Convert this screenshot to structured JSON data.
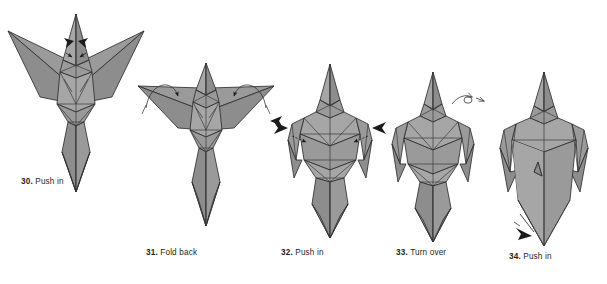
{
  "document": {
    "title": "Origami folding instructions — steps 30 to 34",
    "background_color": "#ffffff"
  },
  "style": {
    "paper_fill_light": "#a6a6a6",
    "paper_fill_mid": "#9a9a9a",
    "paper_fill_dark": "#8d8d8d",
    "paper_fill_darkest": "#818181",
    "crease_line_color": "#3a3a3a",
    "outline_color": "#2f2f2f",
    "arrow_fill": "#1a1a1a",
    "caption_color": "#231f20"
  },
  "steps": [
    {
      "id": "step-30",
      "number": "30.",
      "instruction": "Push in",
      "caption": "30. Push in",
      "arrows": [
        {
          "name": "push-in-arrow-left",
          "type": "solid-triangle",
          "direction": "right"
        },
        {
          "name": "push-in-arrow-right",
          "type": "solid-triangle",
          "direction": "left"
        }
      ]
    },
    {
      "id": "step-31",
      "number": "31.",
      "instruction": "Fold back",
      "caption": "31. Fold back",
      "arrows": [
        {
          "name": "fold-back-arrow-left",
          "type": "curved-loop",
          "direction": "down-left"
        },
        {
          "name": "fold-back-arrow-right",
          "type": "curved-loop",
          "direction": "down-right"
        },
        {
          "name": "push-in-arrow-right-edge",
          "type": "solid-triangle",
          "direction": "left"
        }
      ]
    },
    {
      "id": "step-32",
      "number": "32.",
      "instruction": "Push in",
      "caption": "32. Push in",
      "arrows": [
        {
          "name": "push-in-arrow-left",
          "type": "solid-triangle",
          "direction": "right"
        },
        {
          "name": "push-in-arrow-right",
          "type": "solid-triangle",
          "direction": "left"
        }
      ]
    },
    {
      "id": "step-33",
      "number": "33.",
      "instruction": "Turn over",
      "caption": "33. Turn over",
      "arrows": [
        {
          "name": "turn-over-arrow",
          "type": "loop-outline",
          "direction": "right"
        }
      ]
    },
    {
      "id": "step-34",
      "number": "34.",
      "instruction": "Push in",
      "caption": "34. Push in",
      "arrows": [
        {
          "name": "push-in-arrow-tail",
          "type": "solid-triangle",
          "direction": "up-right"
        }
      ]
    }
  ]
}
